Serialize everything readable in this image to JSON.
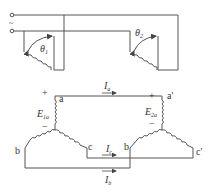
{
  "diagram": {
    "top": {
      "source_symbol": "~",
      "machine1_angle": {
        "sym": "θ",
        "sub": "1"
      },
      "machine2_angle": {
        "sym": "θ",
        "sub": "2"
      }
    },
    "bottom": {
      "left_star": {
        "terminal_a": "a",
        "terminal_b": "b",
        "terminal_c": "c",
        "emf": {
          "sym": "E",
          "sub": "1a"
        },
        "plus": "+",
        "minus": "−"
      },
      "right_star": {
        "terminal_a": "a'",
        "terminal_b": "b",
        "terminal_c": "c'",
        "emf": {
          "sym": "E",
          "sub": "2a"
        },
        "plus": "+",
        "minus": "−"
      },
      "currents": {
        "a": {
          "sym": "I",
          "sub": "a"
        },
        "c": {
          "sym": "I",
          "sub": "c"
        },
        "b": {
          "sym": "I",
          "sub": "b"
        }
      }
    }
  }
}
